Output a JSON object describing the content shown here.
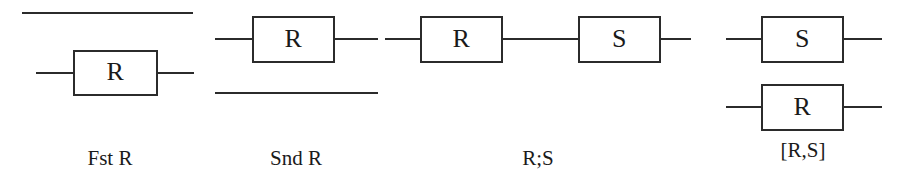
{
  "figure": {
    "background_color": "#ffffff",
    "line_color": "#2b2b2b",
    "text_color": "#1a1a1a",
    "panels": [
      {
        "id": "fst-r",
        "caption": "Fst R",
        "boxes": [
          {
            "label": "R"
          }
        ]
      },
      {
        "id": "snd-r",
        "caption": "Snd R",
        "boxes": [
          {
            "label": "R"
          }
        ]
      },
      {
        "id": "r-seq-s",
        "caption": "R;S",
        "boxes": [
          {
            "label": "R"
          },
          {
            "label": "S"
          }
        ]
      },
      {
        "id": "r-par-s",
        "caption": "[R,S]",
        "boxes": [
          {
            "label": "S"
          },
          {
            "label": "R"
          }
        ]
      }
    ]
  }
}
